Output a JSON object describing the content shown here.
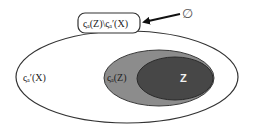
{
  "diagram": {
    "type": "venn-nested-sets",
    "colors": {
      "outer_fill": "#ffffff",
      "outer_stroke": "#333333",
      "middle_fill": "#8c8c8c",
      "middle_stroke": "#3a3a3a",
      "inner_fill": "#474747",
      "inner_stroke": "#2a2a2a",
      "box_stroke": "#333333",
      "arrow": "#111111"
    },
    "sets": {
      "outer": {
        "label": "ςₐ′(X)"
      },
      "middle": {
        "label": "ςₐ(Z)"
      },
      "inner": {
        "label": "Z"
      }
    },
    "difference_box": {
      "label": "ςₐ(Z)\\ςₐ′(X)"
    },
    "arrow_target": {
      "label": "∅"
    }
  }
}
